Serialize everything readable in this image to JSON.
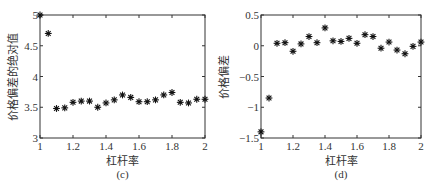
{
  "chart_data": [
    {
      "type": "scatter",
      "panel_label": "(c)",
      "title": "",
      "xlabel": "杠杆率",
      "ylabel": "价格偏差的绝对值",
      "xlim": [
        1,
        2
      ],
      "ylim": [
        3,
        5
      ],
      "xticks": [
        1,
        1.2,
        1.4,
        1.6,
        1.8,
        2
      ],
      "xtick_labels": [
        "1",
        "1.2",
        "1.4",
        "1.6",
        "1.8",
        "2"
      ],
      "yticks": [
        3,
        3.5,
        4,
        4.5,
        5
      ],
      "ytick_labels": [
        "3",
        "3.5",
        "4",
        "4.5",
        "5"
      ],
      "grid": false,
      "marker": "*",
      "color": "#111111",
      "x": [
        1.0,
        1.05,
        1.1,
        1.15,
        1.2,
        1.25,
        1.3,
        1.35,
        1.4,
        1.45,
        1.5,
        1.55,
        1.6,
        1.65,
        1.7,
        1.75,
        1.8,
        1.85,
        1.9,
        1.95,
        2.0
      ],
      "y": [
        5.0,
        4.7,
        3.48,
        3.49,
        3.58,
        3.6,
        3.6,
        3.5,
        3.57,
        3.62,
        3.7,
        3.66,
        3.59,
        3.59,
        3.62,
        3.7,
        3.74,
        3.58,
        3.57,
        3.63,
        3.63
      ]
    },
    {
      "type": "scatter",
      "panel_label": "(d)",
      "title": "",
      "xlabel": "杠杆率",
      "ylabel": "价格偏差",
      "xlim": [
        1,
        2
      ],
      "ylim": [
        -1.5,
        0.5
      ],
      "xticks": [
        1,
        1.2,
        1.4,
        1.6,
        1.8,
        2
      ],
      "xtick_labels": [
        "1",
        "1.2",
        "1.4",
        "1.6",
        "1.8",
        "2"
      ],
      "yticks": [
        -1.5,
        -1,
        -0.5,
        0,
        0.5
      ],
      "ytick_labels": [
        "−1.5",
        "−1",
        "−0.5",
        "0",
        "0.5"
      ],
      "grid": false,
      "marker": "*",
      "color": "#111111",
      "x": [
        1.0,
        1.05,
        1.1,
        1.15,
        1.2,
        1.25,
        1.3,
        1.35,
        1.4,
        1.45,
        1.5,
        1.55,
        1.6,
        1.65,
        1.7,
        1.75,
        1.8,
        1.85,
        1.9,
        1.95,
        2.0
      ],
      "y": [
        -1.4,
        -0.85,
        0.04,
        0.05,
        -0.09,
        0.03,
        0.15,
        0.05,
        0.29,
        0.08,
        0.07,
        0.12,
        0.04,
        0.18,
        0.15,
        -0.04,
        0.06,
        -0.07,
        -0.13,
        -0.01,
        0.06
      ]
    }
  ],
  "colors": {
    "axis": "#333333",
    "marker": "#111111",
    "background": "#ffffff"
  }
}
